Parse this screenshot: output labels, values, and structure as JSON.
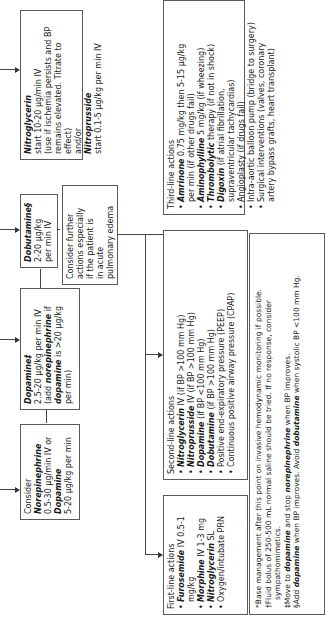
{
  "flowchart": {
    "norepinephrine_box": {
      "line1": "Consider",
      "drug1": "Norepinephrine",
      "dose1": "0.5-30 µg/min IV or",
      "drug2": "Dopamine",
      "dose2": "5-20 µg/kg per min"
    },
    "dopamine_box": {
      "drug": "Dopamine‡",
      "dose": "2.5-20 µg/kg per min IV",
      "note_a": "(add ",
      "note_drug1": "norepinephrine",
      "note_b": " if",
      "note_drug2": "dopamine",
      "note_c": " is >20 µg/kg",
      "note_d": "per min)"
    },
    "dobutamine_box": {
      "drug": "Dobutamine§",
      "dose1": "2-20 µg/kg",
      "dose2": "per min IV"
    },
    "nitroglycerin_box": {
      "drug1": "Nitroglycerin",
      "dose1": "start 10-20 µg/min IV",
      "note1": "(use if ischemia persists and BP",
      "note2": "remains elevated. Titrate to effect)",
      "andor": "and/or",
      "drug2": "Nitroprusside",
      "dose2": "start 0.1-5 µg/kg per min IV"
    },
    "consider_further_box": {
      "lines": [
        "Consider further",
        "actions especially",
        "if  the patient is",
        "in acute",
        "pulmonary edema"
      ]
    },
    "first_line": {
      "title": "First-line actions",
      "items": [
        {
          "drug": "Furosemide",
          "text": " IV 0.5-1 mg/kg"
        },
        {
          "drug": "Morphine",
          "text": " IV 1-3 mg"
        },
        {
          "drug": "Nitroglycerin",
          "text": " SL"
        },
        {
          "drug": "",
          "text": "Oxygen/intubate PRN"
        }
      ]
    },
    "second_line": {
      "title": "Second-line actions",
      "items": [
        {
          "drug": "Nitroglycerin",
          "text": " IV (if BP >100 mm Hg)"
        },
        {
          "drug": "Nitroprusside",
          "text": " IV (if BP >100 mm Hg)"
        },
        {
          "drug": "Dopamine",
          "text": " (if BP <100 mm Hg)"
        },
        {
          "drug": "Dobutamine",
          "text": " (if BP >100 mm Hg)"
        },
        {
          "drug": "",
          "text": "Positive end-expiratory pressure (PEEP)"
        },
        {
          "drug": "",
          "text": "Continuous positive airway pressure (CPAP)"
        }
      ]
    },
    "third_line": {
      "title": "Third-line actions",
      "items": [
        {
          "drug": "Amrinone",
          "text": " 0.75 mg/kg then 5-15 µg/kg",
          "cont": "per min (if other drugs fail)"
        },
        {
          "drug": "Aminophylline",
          "text": " 5 mg/kg (if wheezing)",
          "cont": ""
        },
        {
          "drug": "Thrombolytic",
          "text": " therapy (if not in shock)",
          "cont": ""
        },
        {
          "drug": "Digoxin",
          "text": " (if atrial fibrillation,",
          "cont": "supraventricular tachycardias)"
        },
        {
          "drug": "",
          "text": "Angioplasty (if drugs fail)",
          "cont": ""
        },
        {
          "drug": "",
          "text": "Intra-aortic balloon pump (bridge to surgery)",
          "cont": ""
        },
        {
          "drug": "",
          "text": "Surgical interventions (valves, coronary",
          "cont": "artery bypass grafts, heart transplant)"
        }
      ]
    },
    "footnotes": {
      "star": "*Base management after this point on invasive hemodynamic monitoring if possible.",
      "dagger_1": "†Fluid bolus of 250-500 mL normal saline should be tried. If no response, consider",
      "dagger_2": "sympathomimetics.",
      "ddagger_a": "‡Move to ",
      "ddagger_drug1": "dopamine",
      "ddagger_b": " and stop ",
      "ddagger_drug2": "norepinephrine",
      "ddagger_c": " when BP improves.",
      "section_a": "§Add ",
      "section_drug1": "dopamine",
      "section_b": " when BP improves. Avoid ",
      "section_drug2": "dobutamine",
      "section_c": " when systolic BP <100 mm Hg."
    }
  }
}
